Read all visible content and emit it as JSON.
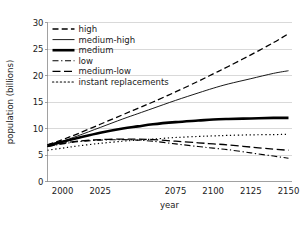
{
  "chart_data": {
    "type": "line",
    "title": "",
    "xlabel": "year",
    "ylabel": "population (billions)",
    "xlim": [
      1990,
      2152
    ],
    "ylim": [
      0,
      30
    ],
    "grid": true,
    "legend_position": "upper-left",
    "xticks": [
      2000,
      2025,
      2075,
      2100,
      2125,
      2150
    ],
    "xtick_labels": [
      "2000",
      "2025",
      "2075",
      "2100",
      "2125",
      "2150"
    ],
    "yticks": [
      0,
      5,
      10,
      15,
      20,
      25,
      30
    ],
    "ytick_labels": [
      "0",
      "5",
      "10",
      "15",
      "20",
      "25",
      "30"
    ],
    "x": [
      1990,
      2000,
      2010,
      2025,
      2040,
      2050,
      2060,
      2075,
      2090,
      2100,
      2110,
      2125,
      2140,
      2150
    ],
    "series": [
      {
        "name": "high",
        "label": "high",
        "style": "dashed",
        "color": "#000000",
        "width": 1.3,
        "values": [
          6.9,
          7.9,
          9.0,
          10.8,
          12.6,
          13.8,
          15.0,
          16.9,
          18.9,
          20.3,
          21.7,
          23.9,
          26.2,
          27.9
        ]
      },
      {
        "name": "medium-high",
        "label": "medium-high",
        "style": "solid-thin",
        "color": "#000000",
        "width": 0.9,
        "values": [
          6.7,
          7.6,
          8.6,
          10.2,
          11.8,
          12.8,
          13.8,
          15.3,
          16.7,
          17.6,
          18.4,
          19.4,
          20.4,
          20.9
        ]
      },
      {
        "name": "medium",
        "label": "medium",
        "style": "solid-thick",
        "color": "#000000",
        "width": 2.6,
        "values": [
          6.8,
          7.5,
          8.2,
          9.2,
          10.0,
          10.4,
          10.8,
          11.2,
          11.5,
          11.7,
          11.8,
          11.9,
          12.0,
          12.0
        ]
      },
      {
        "name": "low",
        "label": "low",
        "style": "dashdot",
        "color": "#000000",
        "width": 1.1,
        "values": [
          6.6,
          7.1,
          7.5,
          7.8,
          7.9,
          7.8,
          7.6,
          7.1,
          6.6,
          6.3,
          6.0,
          5.4,
          4.8,
          4.4
        ]
      },
      {
        "name": "medium-low",
        "label": "medium-low",
        "style": "longdash",
        "color": "#000000",
        "width": 1.3,
        "values": [
          6.6,
          7.2,
          7.6,
          7.9,
          8.0,
          8.0,
          7.9,
          7.6,
          7.3,
          7.1,
          6.9,
          6.5,
          6.1,
          5.9
        ]
      },
      {
        "name": "instant replacements",
        "label": "instant replacements",
        "style": "dotted",
        "color": "#000000",
        "width": 1.2,
        "values": [
          5.9,
          6.3,
          6.7,
          7.2,
          7.6,
          7.8,
          8.0,
          8.3,
          8.5,
          8.6,
          8.7,
          8.8,
          8.85,
          8.9
        ]
      }
    ]
  }
}
